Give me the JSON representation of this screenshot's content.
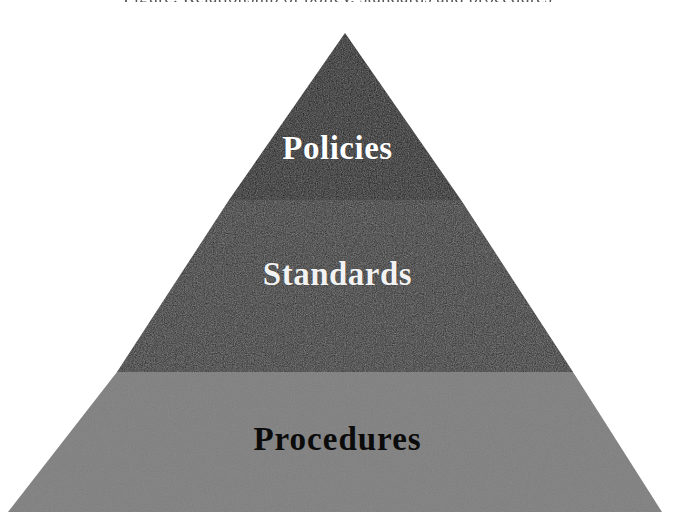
{
  "page": {
    "background_color": "#ffffff",
    "width": 675,
    "height": 521
  },
  "caption": {
    "clipped_top_text": "Figure: Relationship of policy, standards and procedures"
  },
  "diagram": {
    "type": "pyramid",
    "name": "policy-hierarchy-pyramid",
    "apex": {
      "x": 345,
      "y": 33
    },
    "base_left": {
      "x": 8,
      "y": 512
    },
    "base_right": {
      "x": 662,
      "y": 512
    },
    "tier_count": 3,
    "tiers": [
      {
        "id": "policies",
        "label": "Policies",
        "level": 1,
        "position": "top",
        "fill_color": "#0d0d0d",
        "text_color": "#ffffff",
        "top_y": 33,
        "bottom_y": 200,
        "left_x_at_bottom": 229,
        "right_x_at_bottom": 461
      },
      {
        "id": "standards",
        "label": "Standards",
        "level": 2,
        "position": "middle",
        "fill_color": "#282828",
        "text_color": "#f2f2f2",
        "top_y": 200,
        "bottom_y": 372,
        "left_x_at_bottom": 117,
        "right_x_at_bottom": 573
      },
      {
        "id": "procedures",
        "label": "Procedures",
        "level": 3,
        "position": "bottom",
        "fill_color": "#8a8a8a",
        "text_color": "#0b0b0b",
        "top_y": 372,
        "bottom_y": 512,
        "left_x_at_bottom": 8,
        "right_x_at_bottom": 662
      }
    ]
  },
  "colors": {
    "tier_top": "#0d0d0d",
    "tier_middle": "#282828",
    "tier_bottom": "#8a8a8a",
    "background": "#ffffff",
    "light_text": "#ffffff",
    "dark_text": "#0b0b0b"
  }
}
